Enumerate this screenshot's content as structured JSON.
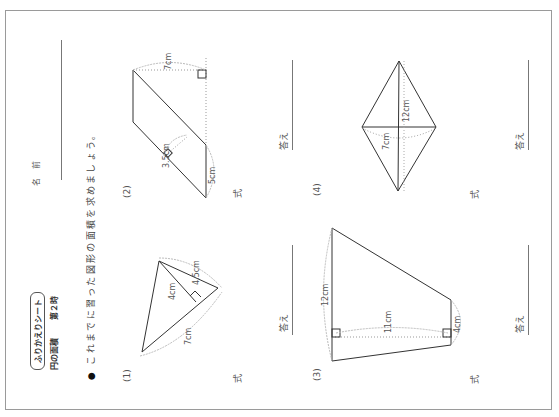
{
  "header": {
    "sheet_title": "ふりかえりシート",
    "unit": "円の面積",
    "lesson": "第２時",
    "name_label": "名 前"
  },
  "instruction": {
    "bullet": "●",
    "text": "これまでに習った図形の面積を求めましょう。"
  },
  "problems": [
    {
      "number": "(1)",
      "shape": "triangle",
      "labels": [
        "4.5cm",
        "4cm",
        "7cm"
      ],
      "formula_label": "式",
      "answer_label": "答え"
    },
    {
      "number": "(2)",
      "shape": "parallelogram",
      "labels": [
        "7cm",
        "3.5cm",
        "5cm"
      ],
      "formula_label": "式",
      "answer_label": "答え"
    },
    {
      "number": "(3)",
      "shape": "trapezoid",
      "labels": [
        "12cm",
        "11cm",
        "4cm"
      ],
      "formula_label": "式",
      "answer_label": "答え"
    },
    {
      "number": "(4)",
      "shape": "rhombus",
      "labels": [
        "12cm",
        "7cm"
      ],
      "formula_label": "式",
      "answer_label": "答え"
    }
  ],
  "colors": {
    "line": "#333333",
    "dotted": "#999999",
    "border": "#9a9a9a"
  }
}
